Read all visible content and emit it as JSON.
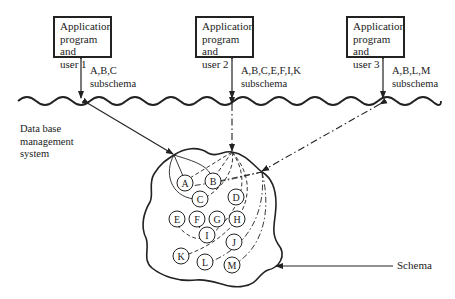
{
  "diagram": {
    "applications": [
      {
        "line1": "Application",
        "line2": "program and",
        "line3": "user 1",
        "subschema_line1": "A,B,C",
        "subschema_line2": "subschema"
      },
      {
        "line1": "Application",
        "line2": "program and",
        "line3": "user 2",
        "subschema_line1": "A,B,C,E,F,I,K",
        "subschema_line2": "subschema"
      },
      {
        "line1": "Application",
        "line2": "program and",
        "line3": "user 3",
        "subschema_line1": "A,B,L,M",
        "subschema_line2": "subschema"
      }
    ],
    "dbms_label": {
      "line1": "Data base",
      "line2": "management",
      "line3": "system"
    },
    "schema_label": "Schema",
    "nodes": [
      "A",
      "B",
      "C",
      "D",
      "E",
      "F",
      "G",
      "H",
      "I",
      "J",
      "K",
      "L",
      "M"
    ]
  }
}
